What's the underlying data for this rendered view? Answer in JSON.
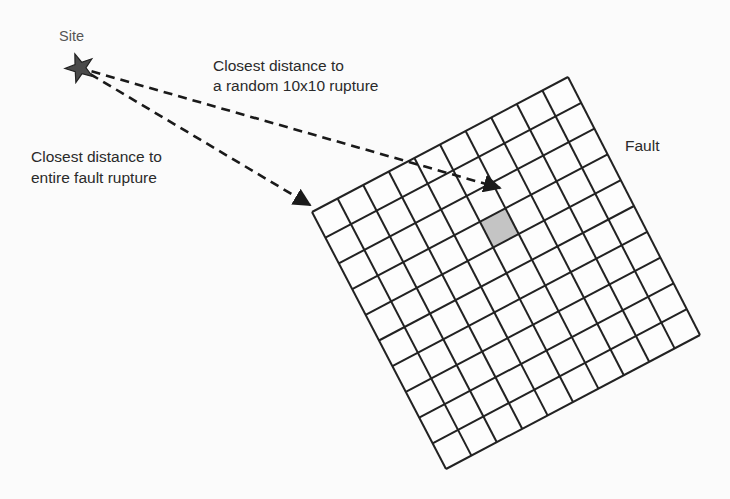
{
  "diagram": {
    "site": {
      "label": "Site",
      "icon": "star-icon",
      "position": [
        80,
        68
      ]
    },
    "fault": {
      "label": "Fault",
      "grid": {
        "rows": 10,
        "cols": 10
      },
      "corners": {
        "top_left": [
          312,
          212
        ],
        "top_right": [
          568,
          77
        ],
        "bottom_right": [
          700,
          335
        ],
        "bottom_left": [
          446,
          469
        ]
      },
      "highlighted_cell": {
        "row": 3,
        "col": 5,
        "fill": "#c4c4c4"
      }
    },
    "arrows": [
      {
        "id": "random-rupture",
        "label_line1": "Closest distance to",
        "label_line2": "a random 10x10 rupture",
        "from": [
          80,
          68
        ],
        "to": [
          500,
          188
        ]
      },
      {
        "id": "entire-fault",
        "label_line1": "Closest distance to",
        "label_line2": "entire fault rupture",
        "from": [
          80,
          68
        ],
        "to": [
          310,
          205
        ]
      }
    ],
    "colors": {
      "line": "#222222",
      "star": "#4a4a4a",
      "text": "#2a2a2a",
      "background": "#fbfbfb"
    }
  }
}
